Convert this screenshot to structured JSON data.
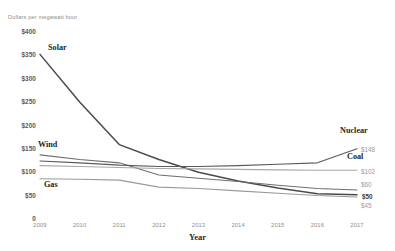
{
  "chart_data": {
    "type": "line",
    "title": "",
    "subtitle": "",
    "ylabel": "Dollars per megawatt hour",
    "xlabel": "Year",
    "x": [
      2009,
      2010,
      2011,
      2012,
      2013,
      2014,
      2015,
      2016,
      2017
    ],
    "categories": [
      "2009",
      "2010",
      "2011",
      "2012",
      "2013",
      "2014",
      "2015",
      "2016",
      "2017"
    ],
    "ylim": [
      0,
      400
    ],
    "yticks": [
      400,
      350,
      300,
      250,
      200,
      150,
      100,
      50,
      0
    ],
    "ytick_labels": [
      "$400",
      "$350",
      "$300",
      "$250",
      "$200",
      "$150",
      "$100",
      "$50",
      "0"
    ],
    "grid": false,
    "legend": "inline-labels",
    "series": [
      {
        "name": "Solar",
        "label": "Solar",
        "color": "#4a4a4a",
        "values": [
          350,
          248,
          157,
          125,
          98,
          79,
          64,
          52,
          50
        ],
        "end_value": 50,
        "end_label": "$50"
      },
      {
        "name": "Wind",
        "label": "Wind",
        "color": "#6e6e6e",
        "values": [
          135,
          125,
          118,
          92,
          85,
          78,
          70,
          63,
          60
        ],
        "end_value": 60,
        "end_label": "$60"
      },
      {
        "name": "Nuclear",
        "label": "Nuclear",
        "color": "#5a5a5a",
        "values": [
          122,
          118,
          113,
          110,
          110,
          112,
          115,
          118,
          148
        ],
        "end_value": 148,
        "end_label": "$148"
      },
      {
        "name": "Coal",
        "label": "Coal",
        "color": "#a8a8a8",
        "values": [
          112,
          110,
          108,
          106,
          105,
          104,
          103,
          102,
          102
        ],
        "end_value": 102,
        "end_label": "$102"
      },
      {
        "name": "Gas",
        "label": "Gas",
        "color": "#9a9a9a",
        "values": [
          84,
          83,
          81,
          66,
          63,
          58,
          53,
          48,
          45
        ],
        "end_value": 45,
        "end_label": "$45"
      }
    ]
  },
  "axis": {
    "y_caption": "Dollars per megawatt hour",
    "x_title": "Year"
  }
}
